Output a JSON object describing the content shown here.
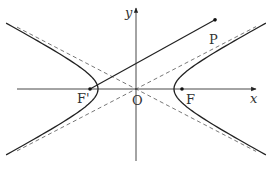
{
  "figure": {
    "axes": {
      "x_label": "x",
      "y_label": "y",
      "origin_label": "O"
    },
    "points": {
      "left_focus": {
        "label": "F'",
        "x": -1.21,
        "y": 0
      },
      "right_focus": {
        "label": "F",
        "x": 1.21,
        "y": 0
      },
      "P": {
        "label": "P",
        "x": 2.08,
        "y": 1.82
      }
    },
    "hyperbola": {
      "a": 1,
      "b": 0.53,
      "branches": [
        "left",
        "right"
      ]
    },
    "asymptote_slope": 0.52,
    "segments": [
      {
        "from": "left_focus",
        "to": "P"
      }
    ],
    "colors": {
      "curve": "#222222",
      "asymptote": "#555555",
      "axis": "#333333",
      "background": "#ffffff"
    }
  }
}
